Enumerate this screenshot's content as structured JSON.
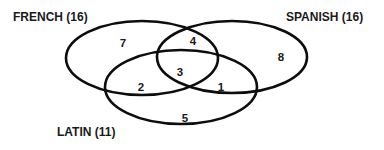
{
  "diagram": {
    "type": "venn",
    "colors": {
      "outline": "#0d0d0d",
      "text": "#1a1a1a",
      "background": "#ffffff"
    },
    "sets": [
      {
        "id": "french",
        "label": "FRENCH (16)",
        "name": "FRENCH",
        "total": 16
      },
      {
        "id": "spanish",
        "label": "SPANISH (16)",
        "name": "SPANISH",
        "total": 16
      },
      {
        "id": "latin",
        "label": "LATIN (11)",
        "name": "LATIN",
        "total": 11
      }
    ],
    "regions": [
      {
        "sets": [
          "french"
        ],
        "value": "7"
      },
      {
        "sets": [
          "french",
          "spanish"
        ],
        "value": "4"
      },
      {
        "sets": [
          "spanish"
        ],
        "value": "8"
      },
      {
        "sets": [
          "french",
          "spanish",
          "latin"
        ],
        "value": "3"
      },
      {
        "sets": [
          "french",
          "latin"
        ],
        "value": "2"
      },
      {
        "sets": [
          "spanish",
          "latin"
        ],
        "value": "1"
      },
      {
        "sets": [
          "latin"
        ],
        "value": "5"
      }
    ]
  }
}
